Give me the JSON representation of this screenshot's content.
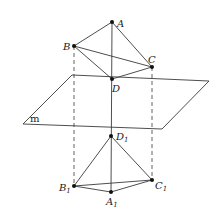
{
  "diagram": {
    "type": "geometry-projection",
    "plane": {
      "label": "m",
      "corners": [
        [
          72,
          75
        ],
        [
          209,
          81
        ],
        [
          162,
          129
        ],
        [
          23,
          124
        ]
      ],
      "label_pos": [
        32,
        121
      ]
    },
    "upper_solid": {
      "points": {
        "A": {
          "label": "A",
          "sub": "",
          "x": 112,
          "y": 22,
          "lx": 117,
          "ly": 26
        },
        "B": {
          "label": "B",
          "sub": "",
          "x": 74,
          "y": 46,
          "lx": 63,
          "ly": 49
        },
        "C": {
          "label": "C",
          "sub": "",
          "x": 152,
          "y": 67,
          "lx": 148,
          "ly": 62
        },
        "D": {
          "label": "D",
          "sub": "",
          "x": 112,
          "y": 79,
          "lx": 112,
          "ly": 91
        }
      },
      "edges": [
        [
          "A",
          "B"
        ],
        [
          "A",
          "C"
        ],
        [
          "A",
          "D"
        ],
        [
          "B",
          "C"
        ],
        [
          "B",
          "D"
        ],
        [
          "C",
          "D"
        ]
      ]
    },
    "lower_solid": {
      "points": {
        "A1": {
          "label": "A",
          "sub": "1",
          "x": 111,
          "y": 192,
          "lx": 106,
          "ly": 204
        },
        "B1": {
          "label": "B",
          "sub": "1",
          "x": 74,
          "y": 186,
          "lx": 59,
          "ly": 190
        },
        "C1": {
          "label": "C",
          "sub": "1",
          "x": 152,
          "y": 180,
          "lx": 155,
          "ly": 188
        },
        "D1": {
          "label": "D",
          "sub": "1",
          "x": 111,
          "y": 136,
          "lx": 117,
          "ly": 139
        }
      },
      "edges": [
        [
          "D1",
          "B1"
        ],
        [
          "D1",
          "C1"
        ],
        [
          "D1",
          "A1"
        ],
        [
          "B1",
          "C1"
        ],
        [
          "B1",
          "A1"
        ],
        [
          "A1",
          "C1"
        ]
      ]
    },
    "projection_lines": {
      "solid": [
        [
          "D",
          "D1"
        ]
      ],
      "dashed": [
        [
          "B",
          "B1"
        ],
        [
          "C",
          "C1"
        ]
      ]
    },
    "labels": {
      "A": "A",
      "B": "B",
      "C": "C",
      "D": "D",
      "A1": "A",
      "B1": "B",
      "C1": "C",
      "D1": "D",
      "sub1": "1",
      "plane": "m"
    },
    "colors": {
      "line": "#3a3a3a",
      "point": "#111111",
      "text": "#1a1a1a"
    }
  }
}
